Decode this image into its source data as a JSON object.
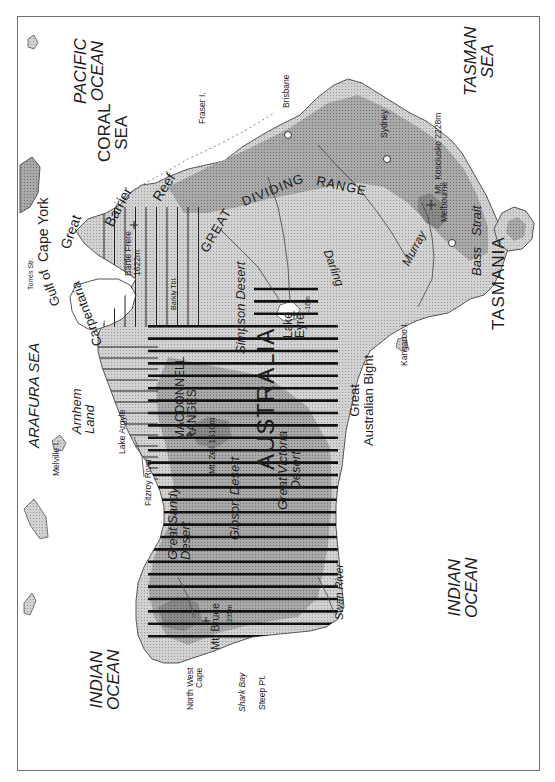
{
  "map": {
    "subject": "Australia physical map",
    "orientation_note": "North points to the left",
    "colors": {
      "border": "#6f6f6f",
      "sea": "#ffffff",
      "lowland": "#d6d6d6",
      "upland": "#a8a8a8",
      "highland": "#7c7c7c",
      "coast_line": "#555555",
      "hatch": "#111111",
      "river": "#444444"
    },
    "oceans_and_seas": {
      "pacific_ocean": [
        "PACIFIC",
        "OCEAN"
      ],
      "coral_sea": [
        "CORAL",
        "SEA"
      ],
      "tasman_sea": [
        "TASMAN",
        "SEA"
      ],
      "arafura_sea": "ARAFURA SEA",
      "indian_ocean_west": [
        "INDIAN",
        "OCEAN"
      ],
      "indian_ocean_south": [
        "INDIAN",
        "OCEAN"
      ]
    },
    "major_labels": {
      "country": "AUSTRALIA",
      "tasmania": "TASMANIA",
      "great_barrier_reef": [
        "Great",
        "Barrier",
        "Reef"
      ],
      "great_dividing_range": [
        "GREAT",
        "DIVIDING",
        "RANGE"
      ],
      "macdonnell_ranges": [
        "MACDONNELL",
        "RANGES"
      ],
      "gulf_of_carpentaria": [
        "Gulf of",
        "Carpentaria"
      ],
      "great_australian_bight": [
        "Great",
        "Australian Bight"
      ],
      "bass_strait": [
        "Bass",
        "Strait"
      ],
      "cape_york": "Cape York",
      "arnhem_land": [
        "Arnhem",
        "Land"
      ]
    },
    "deserts": {
      "simpson": "Simpson Desert",
      "great_sandy": [
        "Great Sandy",
        "Desert"
      ],
      "gibson": "Gibson Desert",
      "great_victoria": [
        "Great Victoria",
        "Desert"
      ]
    },
    "rivers": {
      "darling": "Darling",
      "murray": "Murray",
      "swan": "Swan River",
      "fitzroy": "Fitzroy River"
    },
    "lakes": {
      "eyre": [
        "Lake",
        "Eyre"
      ],
      "eyre_elevation": "-16m",
      "argyle": "Lake Argyle"
    },
    "peaks": {
      "kosciusko": "Mt. Kosciusko 2228m",
      "bartle_frere": [
        "Bartle Frere",
        "1622m"
      ],
      "zeil": "Mt. Zeil 1510m",
      "bruce": "Mt. Bruce",
      "bruce_elevation": "1235m"
    },
    "places": {
      "brisbane": "Brisbane",
      "sydney": "Sydney",
      "melbourne": "Melbourne",
      "fraser_island": "Fraser I.",
      "kangaroo_island": "Kangaroo I.",
      "melville_island": "Melville I.",
      "torres_strait": "Torres Str.",
      "north_west_cape": [
        "North West",
        "Cape"
      ],
      "shark_bay": "Shark Bay",
      "steep_point": "Steep Pt.",
      "barkly_tableland": "Barkly Tbl."
    }
  }
}
